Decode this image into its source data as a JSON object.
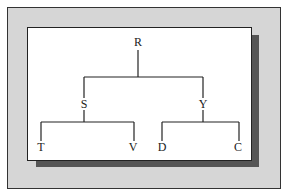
{
  "diagram": {
    "type": "tree",
    "root": "R",
    "nodes": [
      {
        "id": "R",
        "label": "R",
        "x": 138,
        "y": 42,
        "parent": null
      },
      {
        "id": "S",
        "label": "S",
        "x": 84,
        "y": 104,
        "parent": "R"
      },
      {
        "id": "Y",
        "label": "Y",
        "x": 203,
        "y": 104,
        "parent": "R"
      },
      {
        "id": "T",
        "label": "T",
        "x": 41,
        "y": 147,
        "parent": "S"
      },
      {
        "id": "V",
        "label": "V",
        "x": 133,
        "y": 147,
        "parent": "S"
      },
      {
        "id": "D",
        "label": "D",
        "x": 162,
        "y": 147,
        "parent": "Y"
      },
      {
        "id": "C",
        "label": "C",
        "x": 238,
        "y": 147,
        "parent": "Y"
      }
    ],
    "edges": [
      [
        "R",
        "S"
      ],
      [
        "R",
        "Y"
      ],
      [
        "S",
        "T"
      ],
      [
        "S",
        "V"
      ],
      [
        "Y",
        "D"
      ],
      [
        "Y",
        "C"
      ]
    ],
    "colors": {
      "frame_background": "#d6d6d6",
      "card_background": "#ffffff",
      "shadow": "#555555",
      "line": "#222222"
    }
  }
}
